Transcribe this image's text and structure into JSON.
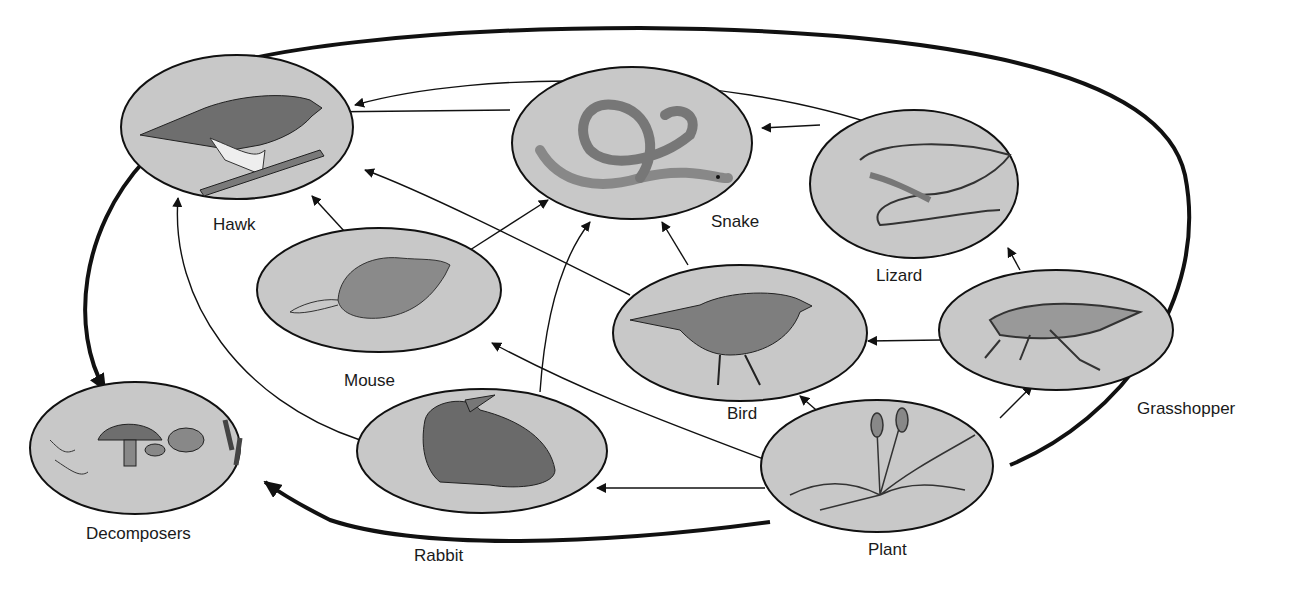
{
  "diagram": {
    "type": "food-web",
    "colors": {
      "node_fill": "#c8c8c8",
      "stroke": "#111111",
      "background": "#ffffff"
    },
    "nodes": [
      {
        "id": "hawk",
        "label": "Hawk",
        "icon": "hawk-icon"
      },
      {
        "id": "snake",
        "label": "Snake",
        "icon": "snake-icon"
      },
      {
        "id": "lizard",
        "label": "Lizard",
        "icon": "lizard-icon"
      },
      {
        "id": "mouse",
        "label": "Mouse",
        "icon": "mouse-icon"
      },
      {
        "id": "bird",
        "label": "Bird",
        "icon": "bird-icon"
      },
      {
        "id": "grasshopper",
        "label": "Grasshopper",
        "icon": "grasshopper-icon"
      },
      {
        "id": "decomposers",
        "label": "Decomposers",
        "icon": "mushroom-bacteria-icon"
      },
      {
        "id": "rabbit",
        "label": "Rabbit",
        "icon": "rabbit-icon"
      },
      {
        "id": "plant",
        "label": "Plant",
        "icon": "grass-icon"
      }
    ],
    "edges": [
      {
        "from": "snake",
        "to": "hawk"
      },
      {
        "from": "lizard",
        "to": "hawk"
      },
      {
        "from": "mouse",
        "to": "hawk"
      },
      {
        "from": "bird",
        "to": "hawk"
      },
      {
        "from": "rabbit",
        "to": "hawk"
      },
      {
        "from": "lizard",
        "to": "snake"
      },
      {
        "from": "mouse",
        "to": "snake"
      },
      {
        "from": "bird",
        "to": "snake"
      },
      {
        "from": "rabbit",
        "to": "snake"
      },
      {
        "from": "grasshopper",
        "to": "lizard"
      },
      {
        "from": "grasshopper",
        "to": "bird"
      },
      {
        "from": "plant",
        "to": "grasshopper"
      },
      {
        "from": "plant",
        "to": "bird"
      },
      {
        "from": "plant",
        "to": "mouse"
      },
      {
        "from": "plant",
        "to": "rabbit"
      },
      {
        "from": "hawk",
        "to": "decomposers",
        "weight": "heavy"
      },
      {
        "from": "plant",
        "to": "decomposers",
        "weight": "heavy"
      }
    ]
  }
}
